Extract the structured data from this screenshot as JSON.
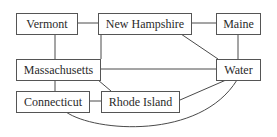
{
  "diagram": {
    "type": "graph",
    "nodes": [
      {
        "id": "vermont",
        "label": "Vermont"
      },
      {
        "id": "new_hampshire",
        "label": "New Hampshire"
      },
      {
        "id": "maine",
        "label": "Maine"
      },
      {
        "id": "massachusetts",
        "label": "Massachusetts"
      },
      {
        "id": "water",
        "label": "Water"
      },
      {
        "id": "connecticut",
        "label": "Connecticut"
      },
      {
        "id": "rhode_island",
        "label": "Rhode Island"
      }
    ],
    "edges": [
      [
        "Vermont",
        "New Hampshire"
      ],
      [
        "New Hampshire",
        "Maine"
      ],
      [
        "Vermont",
        "Massachusetts"
      ],
      [
        "New Hampshire",
        "Massachusetts"
      ],
      [
        "New Hampshire",
        "Water"
      ],
      [
        "Maine",
        "Water"
      ],
      [
        "Massachusetts",
        "Water"
      ],
      [
        "Massachusetts",
        "Connecticut"
      ],
      [
        "Massachusetts",
        "Rhode Island"
      ],
      [
        "Connecticut",
        "Rhode Island"
      ],
      [
        "Rhode Island",
        "Water"
      ],
      [
        "Connecticut",
        "Water"
      ]
    ]
  }
}
